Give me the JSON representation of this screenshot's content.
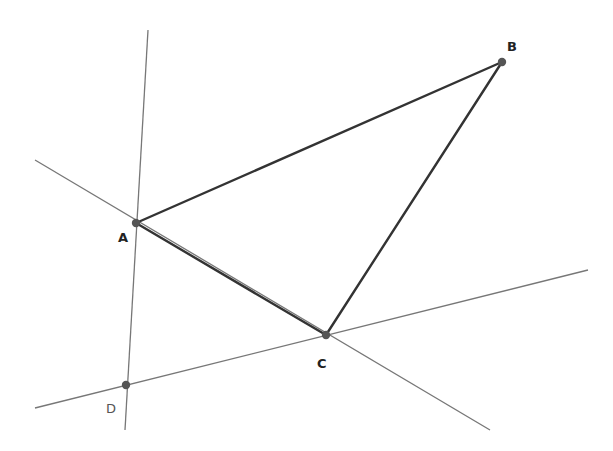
{
  "diagram": {
    "type": "geometry-construction",
    "colors": {
      "background": "#ffffff",
      "triangle_edge": "#333333",
      "auxiliary_line": "#777777",
      "point": "#555555"
    },
    "points": [
      {
        "id": "A",
        "label": "A",
        "x": 136,
        "y": 223,
        "label_x": 118,
        "label_y": 242
      },
      {
        "id": "B",
        "label": "B",
        "x": 502,
        "y": 62,
        "label_x": 507,
        "label_y": 51
      },
      {
        "id": "C",
        "label": "C",
        "x": 326,
        "y": 335,
        "label_x": 317,
        "label_y": 368
      },
      {
        "id": "D",
        "label": "D",
        "x": 126,
        "y": 385,
        "label_x": 106,
        "label_y": 413
      }
    ],
    "segments": [
      {
        "id": "AB",
        "from": "A",
        "to": "B",
        "x1": 136,
        "y1": 223,
        "x2": 502,
        "y2": 62
      },
      {
        "id": "BC",
        "from": "B",
        "to": "C",
        "x1": 502,
        "y1": 62,
        "x2": 326,
        "y2": 335
      },
      {
        "id": "AC",
        "from": "A",
        "to": "C",
        "x1": 136,
        "y1": 223,
        "x2": 326,
        "y2": 335
      }
    ],
    "lines": [
      {
        "id": "line-through-A-D",
        "x1": 148,
        "y1": 30,
        "x2": 125,
        "y2": 430
      },
      {
        "id": "line-through-A-C",
        "x1": 35,
        "y1": 160,
        "x2": 490,
        "y2": 430
      },
      {
        "id": "line-through-D-C",
        "x1": 35,
        "y1": 408,
        "x2": 588,
        "y2": 270
      }
    ]
  }
}
